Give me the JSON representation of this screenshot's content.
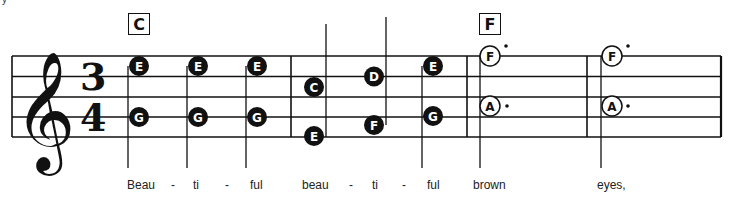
{
  "score": {
    "clef": "treble",
    "time_signature": {
      "top": "3",
      "bottom": "4"
    },
    "corner_mark": "y",
    "chords": [
      {
        "label": "C",
        "x": 128
      },
      {
        "label": "F",
        "x": 479
      }
    ],
    "measures": [
      {
        "notes": [
          {
            "pitches": [
              "E",
              "G"
            ],
            "x": 139,
            "type": "quarter",
            "stem": "down"
          },
          {
            "pitches": [
              "E",
              "G"
            ],
            "x": 198,
            "type": "quarter",
            "stem": "down"
          },
          {
            "pitches": [
              "E",
              "G"
            ],
            "x": 257,
            "type": "quarter",
            "stem": "down"
          }
        ]
      },
      {
        "notes": [
          {
            "pitches": [
              "C",
              "E"
            ],
            "x": 314,
            "type": "quarter",
            "stem": "up"
          },
          {
            "pitches": [
              "D",
              "F"
            ],
            "x": 374,
            "type": "quarter",
            "stem": "up"
          },
          {
            "pitches": [
              "E",
              "G"
            ],
            "x": 433,
            "type": "quarter",
            "stem": "down"
          }
        ]
      },
      {
        "notes": [
          {
            "pitches": [
              "F",
              "A"
            ],
            "x": 490,
            "type": "dotted-half",
            "stem": "down"
          }
        ]
      },
      {
        "notes": [
          {
            "pitches": [
              "F",
              "A"
            ],
            "x": 612,
            "type": "dotted-half",
            "stem": "down"
          }
        ]
      }
    ],
    "lyrics": [
      {
        "text": "Beau",
        "x": 127
      },
      {
        "text": "-",
        "x": 171
      },
      {
        "text": "ti",
        "x": 193
      },
      {
        "text": "-",
        "x": 225
      },
      {
        "text": "ful",
        "x": 250
      },
      {
        "text": "beau",
        "x": 302
      },
      {
        "text": "-",
        "x": 349
      },
      {
        "text": "ti",
        "x": 372
      },
      {
        "text": "-",
        "x": 402
      },
      {
        "text": "ful",
        "x": 427
      },
      {
        "text": "brown",
        "x": 473
      },
      {
        "text": "eyes,",
        "x": 597
      }
    ]
  }
}
